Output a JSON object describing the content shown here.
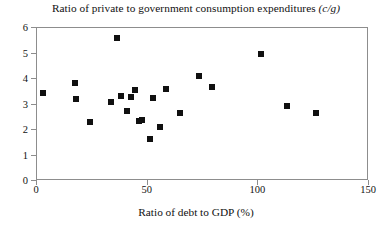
{
  "chart_data": {
    "type": "scatter",
    "title": "Ratio of private to government consumption expenditures (c/g)",
    "title_plain": "Ratio of private to government consumption expenditures",
    "title_italic_suffix": "(c/g)",
    "xlabel": "Ratio of debt to GDP (%)",
    "ylabel": "",
    "xlim": [
      0,
      150
    ],
    "ylim": [
      0,
      6
    ],
    "xticks": [
      0,
      50,
      100,
      150
    ],
    "yticks": [
      0,
      1,
      2,
      3,
      4,
      5,
      6
    ],
    "xtick_labels": [
      "0",
      "50",
      "100",
      "150"
    ],
    "ytick_labels": [
      "0",
      "1",
      "2",
      "3",
      "4",
      "5",
      "6"
    ],
    "grid": false,
    "legend": false,
    "marker": "square",
    "marker_color": "#101010",
    "marker_size_px": 6,
    "points": [
      {
        "x": 2.5,
        "y": 3.45
      },
      {
        "x": 17.0,
        "y": 3.85
      },
      {
        "x": 17.5,
        "y": 3.2
      },
      {
        "x": 24.0,
        "y": 2.3
      },
      {
        "x": 33.5,
        "y": 3.1
      },
      {
        "x": 36.0,
        "y": 5.6
      },
      {
        "x": 38.0,
        "y": 3.35
      },
      {
        "x": 40.5,
        "y": 2.75
      },
      {
        "x": 42.5,
        "y": 3.3
      },
      {
        "x": 44.5,
        "y": 3.55
      },
      {
        "x": 46.0,
        "y": 2.35
      },
      {
        "x": 47.5,
        "y": 2.4
      },
      {
        "x": 51.0,
        "y": 1.65
      },
      {
        "x": 52.5,
        "y": 3.25
      },
      {
        "x": 55.5,
        "y": 2.1
      },
      {
        "x": 58.5,
        "y": 3.6
      },
      {
        "x": 64.5,
        "y": 2.65
      },
      {
        "x": 73.0,
        "y": 4.1
      },
      {
        "x": 79.0,
        "y": 3.7
      },
      {
        "x": 101.0,
        "y": 5.0
      },
      {
        "x": 113.0,
        "y": 2.95
      },
      {
        "x": 126.0,
        "y": 2.65
      }
    ],
    "point_count": 22
  },
  "colors": {
    "marker": "#101010",
    "axis": "#8d8d8d",
    "text": "#111111",
    "background": "#ffffff"
  }
}
